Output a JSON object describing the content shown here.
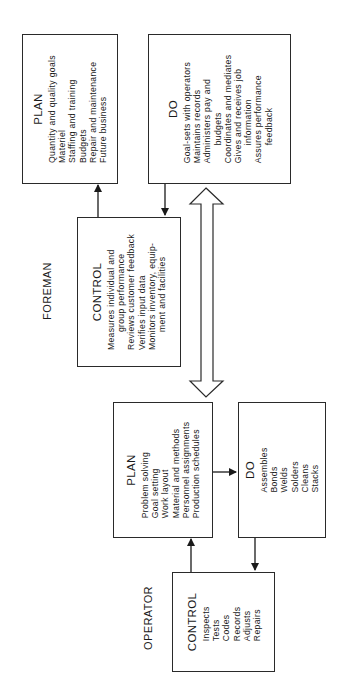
{
  "orientation": "rotated-90-ccw",
  "groups": {
    "foreman": {
      "label": "FOREMAN",
      "plan": {
        "title": "PLAN",
        "items": [
          "Quantity and quality goals",
          "Materiel",
          "Staffing and training",
          "Budgets",
          "Repair and maintenance",
          "Future business"
        ]
      },
      "do": {
        "title": "DO",
        "items": [
          "Goal-sets with operators",
          "Maintains records",
          "Administers pay and",
          "budgets",
          "Coordinates and mediates",
          "Gives and receives job",
          "information",
          "Assures performance",
          "feedback"
        ]
      },
      "control": {
        "title": "CONTROL",
        "items": [
          "Measures individual and",
          "group performance",
          "Reviews customer feedback",
          "Verifies input data",
          "Monitors inventory, equip-",
          "ment and facilities"
        ]
      }
    },
    "operator": {
      "label": "OPERATOR",
      "plan": {
        "title": "PLAN",
        "items": [
          "Problem solving",
          "Goal setting",
          "Work layout",
          "Material and methods",
          "Personnel assignments",
          "Production schedules"
        ]
      },
      "do": {
        "title": "DO",
        "items": [
          "Assembles",
          "Bonds",
          "Welds",
          "Solders",
          "Cleans",
          "Stacks"
        ]
      },
      "control": {
        "title": "CONTROL",
        "items": [
          "Inspects",
          "Tests",
          "Codes",
          "Records",
          "Adjusts",
          "Repairs"
        ]
      }
    }
  },
  "connectors": [
    {
      "from": "foreman.control",
      "to": "foreman.plan",
      "type": "arrow"
    },
    {
      "from": "foreman.do",
      "to": "foreman.control",
      "type": "arrow"
    },
    {
      "from": "foreman",
      "to": "operator",
      "type": "double-block-arrow"
    },
    {
      "from": "operator.plan",
      "to": "operator.do",
      "type": "arrow"
    },
    {
      "from": "operator.do",
      "to": "operator.control",
      "type": "arrow"
    },
    {
      "from": "operator.control",
      "to": "operator.plan",
      "type": "arrow"
    }
  ],
  "colors": {
    "line": "#2a2a2a",
    "text": "#1a1a1a",
    "background": "#ffffff"
  }
}
